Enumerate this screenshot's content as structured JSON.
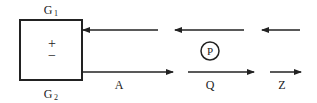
{
  "diagram": {
    "box": {
      "top_label": "G",
      "top_label_sub": "1",
      "bottom_label": "G",
      "bottom_label_sub": "2",
      "plus": "+",
      "minus": "−"
    },
    "labels": {
      "a": "A",
      "q": "Q",
      "z": "Z",
      "p": "P"
    },
    "colors": {
      "stroke": "#222222",
      "background": "#ffffff"
    }
  }
}
